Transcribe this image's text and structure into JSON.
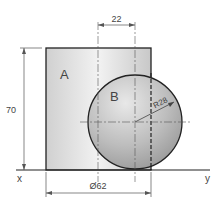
{
  "diagram": {
    "labels": {
      "region_a": "A",
      "region_b": "B",
      "axis_x": "x",
      "axis_y": "y"
    },
    "dimensions": {
      "offset": "22",
      "height": "70",
      "radius": "R28",
      "diameter": "Ø62"
    },
    "colors": {
      "outline": "#222222",
      "fill_light": "#e6e6e6",
      "fill_dark": "#b8b8b8",
      "dim_line": "#555555"
    }
  }
}
